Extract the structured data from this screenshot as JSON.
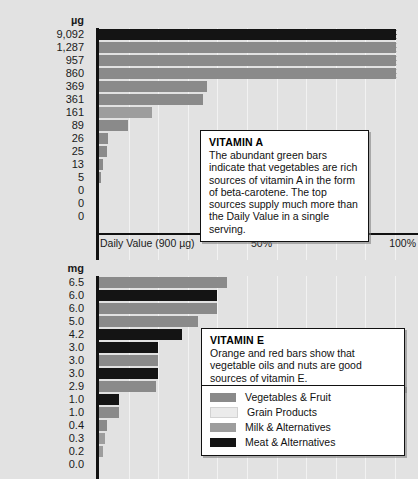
{
  "chart_data": [
    {
      "type": "bar",
      "orientation": "horizontal",
      "id": "vitamin-a",
      "title": "VITAMIN A",
      "unit_label": "µg",
      "xlabel": "Daily Value (900 µg)",
      "xticks": [
        "Daily Value (900 µg)",
        "50%",
        "100%"
      ],
      "xtick_percent": [
        0,
        50,
        100
      ],
      "xlim": [
        0,
        100
      ],
      "grid": true,
      "legend": "shared",
      "values": [
        9092,
        1287,
        957,
        860,
        369,
        361,
        161,
        89,
        26,
        25,
        13,
        5,
        0,
        0,
        0
      ],
      "tick_labels": [
        "9,092",
        "1,287",
        "957",
        "860",
        "369",
        "361",
        "161",
        "89",
        "26",
        "25",
        "13",
        "5",
        "0",
        "0",
        "0"
      ],
      "percent_of_dv": [
        100,
        100,
        100,
        95.5,
        36.5,
        35.2,
        17.9,
        9.9,
        2.9,
        2.8,
        1.4,
        0.6,
        0,
        0,
        0
      ],
      "clipped": [
        true,
        true,
        true,
        true,
        false,
        false,
        false,
        false,
        false,
        false,
        false,
        false,
        false,
        false,
        false
      ],
      "groups": [
        "meat",
        "veg",
        "veg",
        "veg",
        "veg",
        "veg",
        "milk",
        "veg",
        "veg",
        "veg",
        "veg",
        "veg",
        "veg",
        "veg",
        "veg"
      ]
    },
    {
      "type": "bar",
      "orientation": "horizontal",
      "id": "vitamin-e",
      "title": "VITAMIN E",
      "unit_label": "mg",
      "xlabel": "",
      "xlim": [
        0,
        100
      ],
      "grid": true,
      "legend": "bottom-right",
      "values": [
        6.5,
        6.0,
        6.0,
        5.0,
        4.2,
        3.0,
        3.0,
        3.0,
        2.9,
        1.0,
        1.0,
        0.4,
        0.3,
        0.2,
        0.0
      ],
      "tick_labels": [
        "6.5",
        "6.0",
        "6.0",
        "5.0",
        "4.2",
        "3.0",
        "3.0",
        "3.0",
        "2.9",
        "1.0",
        "1.0",
        "0.4",
        "0.3",
        "0.2",
        "0.0"
      ],
      "percent_of_dv": [
        43.3,
        40.0,
        40.0,
        33.3,
        28.0,
        20.0,
        20.0,
        20.0,
        19.3,
        6.7,
        6.7,
        2.7,
        2.0,
        1.3,
        0.0
      ],
      "clipped": [
        false,
        false,
        false,
        false,
        false,
        false,
        false,
        false,
        false,
        false,
        false,
        false,
        false,
        false,
        false
      ],
      "groups": [
        "veg",
        "meat",
        "veg",
        "veg",
        "meat",
        "meat",
        "veg",
        "meat",
        "veg",
        "meat",
        "veg",
        "veg",
        "milk",
        "milk",
        "veg"
      ]
    }
  ],
  "callouts": {
    "vitamin_a": {
      "heading": "VITAMIN A",
      "body": "The abundant green bars indicate that vegetables are rich sources of vitamin A in the form of beta-carotene. The top sources supply much more than the Daily Value in a single serving."
    },
    "vitamin_e": {
      "heading": "VITAMIN E",
      "body": "Orange and red bars show that vegetable oils and nuts are good sources of vitamin E."
    }
  },
  "legend": {
    "items": [
      {
        "label": "Vegetables & Fruit",
        "key": "veg",
        "color": "#8a8a8a"
      },
      {
        "label": "Grain Products",
        "key": "grain",
        "color": "#ebebeb"
      },
      {
        "label": "Milk & Alternatives",
        "key": "milk",
        "color": "#9d9d9d"
      },
      {
        "label": "Meat & Alternatives",
        "key": "meat",
        "color": "#141414"
      }
    ]
  },
  "colors": {
    "background": "#e2e2e2",
    "axis": "#111111",
    "grid": "#f2f2f2",
    "callout_bg": "#ffffff",
    "text": "#1a1a1a"
  }
}
